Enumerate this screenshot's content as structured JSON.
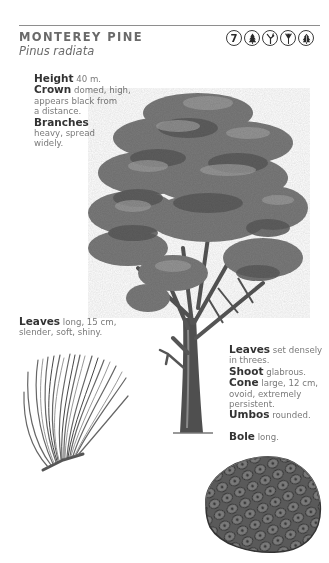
{
  "header": {
    "common_name": "MONTEREY PINE",
    "scientific_name": "Pinus radiata",
    "badges": [
      {
        "type": "number",
        "label": "7",
        "icon": "number-7-icon"
      },
      {
        "type": "icon",
        "icon": "conifer-tree-icon"
      },
      {
        "type": "icon",
        "icon": "branching-twig-icon"
      },
      {
        "type": "icon",
        "icon": "needle-cluster-icon"
      },
      {
        "type": "icon",
        "icon": "broad-conifer-icon"
      }
    ]
  },
  "tree_notes": {
    "height_label": "Height",
    "height_text": "40 m.",
    "crown_label": "Crown",
    "crown_text_1": "domed, high,",
    "crown_text_2": "appears black from",
    "crown_text_3": "a distance.",
    "branches_label": "Branches",
    "branches_text_1": "heavy, spread",
    "branches_text_2": "widely."
  },
  "leaf_notes": {
    "leaves_label": "Leaves",
    "leaves_text_1": "long, 15 cm,",
    "leaves_text_2": "slender, soft, shiny."
  },
  "detail_notes": {
    "leaves_label": "Leaves",
    "leaves_text_1": "set densely",
    "leaves_text_2": "in threes.",
    "shoot_label": "Shoot",
    "shoot_text": "glabrous.",
    "cone_label": "Cone",
    "cone_text_1": "large, 12 cm,",
    "cone_text_2": "ovoid, extremely",
    "cone_text_3": "persistent.",
    "umbos_label": "Umbos",
    "umbos_text": "rounded.",
    "bole_label": "Bole",
    "bole_text": "long."
  },
  "illustrations": {
    "tree": "monterey-pine-tree-illustration",
    "needles": "pine-needle-cluster-illustration",
    "cone": "pine-cone-illustration"
  },
  "colors": {
    "rule": "#8e8e8e",
    "heading": "#6a6a6a",
    "label": "#333333",
    "body": "#7a7a7a"
  }
}
